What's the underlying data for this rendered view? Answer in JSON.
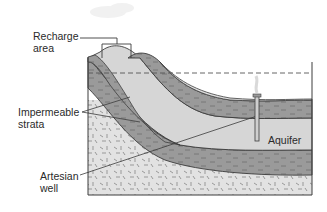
{
  "figure": {
    "type": "cross-section",
    "colors": {
      "impermeable": "#9a9a9a",
      "aquifer": "#d6d6d6",
      "bedrock": "#e2e2e2",
      "outline": "#3c3c3c",
      "water_table": "#555555"
    }
  },
  "labels": {
    "recharge_line1": "Recharge",
    "recharge_line2": "area",
    "impermeable_line1": "Impermeable",
    "impermeable_line2": "strata",
    "artesian_line1": "Artesian",
    "artesian_line2": "well",
    "aquifer": "Aquifer"
  }
}
